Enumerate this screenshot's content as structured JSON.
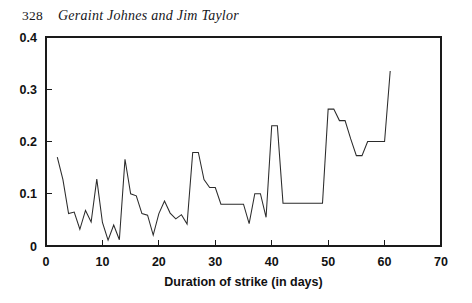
{
  "header": {
    "page_number": "328",
    "title": "Geraint Johnes and Jim Taylor"
  },
  "chart_data": {
    "type": "line",
    "title": "",
    "subtitle": "",
    "xlabel": "Duration of strike (in days)",
    "ylabel": "",
    "xlim": [
      0,
      70
    ],
    "ylim": [
      0,
      0.4
    ],
    "x_ticks": [
      0,
      10,
      20,
      30,
      40,
      50,
      60,
      70
    ],
    "x_tick_labels": [
      "0",
      "10",
      "20",
      "30",
      "40",
      "50",
      "60",
      "70"
    ],
    "y_ticks": [
      0,
      0.1,
      0.2,
      0.3,
      0.4
    ],
    "y_tick_labels": [
      "0",
      "0.1",
      "0.2",
      "0.3",
      "0.4"
    ],
    "grid": false,
    "legend": null,
    "annotations": [],
    "line_color": "#2b2b2b",
    "series": [
      {
        "name": "hazard rate",
        "x": [
          2,
          3,
          4,
          5,
          6,
          7,
          8,
          9,
          10,
          11,
          12,
          13,
          14,
          15,
          16,
          17,
          18,
          19,
          20,
          21,
          22,
          23,
          24,
          25,
          26,
          27,
          28,
          29,
          30,
          31,
          32,
          33,
          34,
          35,
          36,
          37,
          38,
          39,
          40,
          41,
          42,
          43,
          44,
          45,
          46,
          47,
          48,
          49,
          50,
          51,
          52,
          53,
          54,
          55,
          56,
          57,
          58,
          59,
          60,
          61
        ],
        "values": [
          0.17,
          0.127,
          0.062,
          0.065,
          0.032,
          0.068,
          0.046,
          0.128,
          0.045,
          0.011,
          0.04,
          0.012,
          0.166,
          0.1,
          0.096,
          0.062,
          0.059,
          0.021,
          0.062,
          0.086,
          0.063,
          0.052,
          0.06,
          0.042,
          0.179,
          0.179,
          0.127,
          0.112,
          0.112,
          0.08,
          0.08,
          0.08,
          0.08,
          0.08,
          0.043,
          0.1,
          0.1,
          0.055,
          0.23,
          0.23,
          0.082,
          0.082,
          0.082,
          0.082,
          0.082,
          0.082,
          0.082,
          0.082,
          0.262,
          0.262,
          0.24,
          0.24,
          0.205,
          0.173,
          0.173,
          0.2,
          0.2,
          0.2,
          0.2,
          0.335
        ]
      }
    ]
  }
}
